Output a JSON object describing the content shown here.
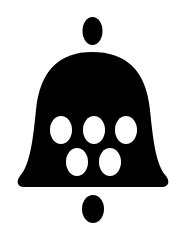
{
  "icon": {
    "name": "bell-icon",
    "fill": "#000000",
    "background": "#ffffff",
    "hole_color": "#ffffff",
    "hole_rows": [
      3,
      2
    ]
  }
}
